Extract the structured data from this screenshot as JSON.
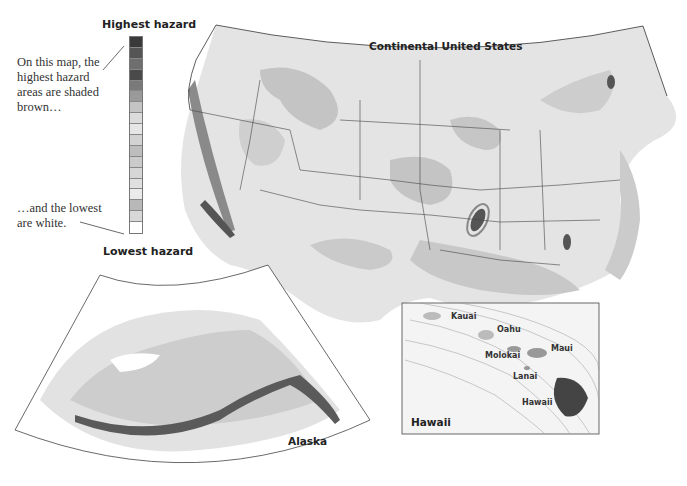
{
  "legend": {
    "highest_label": "Highest hazard",
    "lowest_label": "Lowest hazard",
    "annotation_top": "On this map, the highest hazard areas are shaded brown…",
    "annotation_bottom": "…and the lowest are white.",
    "swatches": [
      "#3a3a3a",
      "#555555",
      "#6e6e6e",
      "#4a4a4a",
      "#7a7a7a",
      "#9a9a9a",
      "#c4c4c4",
      "#dcdcdc",
      "#e6e6e6",
      "#d2d2d2",
      "#bdbdbd",
      "#cbcbcb",
      "#d6d6d6",
      "#e0e0e0",
      "#ebebeb",
      "#b8b8b8",
      "#d8d8d8",
      "#ffffff"
    ]
  },
  "maps": {
    "continental": {
      "title": "Continental United States"
    },
    "alaska": {
      "title": "Alaska"
    },
    "hawaii": {
      "title": "Hawaii",
      "islands": [
        "Kauai",
        "Oahu",
        "Molokai",
        "Maui",
        "Lanai",
        "Hawaii"
      ]
    }
  },
  "colors": {
    "low": "#ffffff",
    "light": "#e6e6e6",
    "mid": "#c8c8c8",
    "mid_dark": "#a8a8a8",
    "high": "#555555",
    "border": "#333333"
  }
}
